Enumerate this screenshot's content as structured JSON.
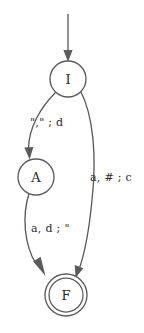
{
  "diagram": {
    "kind": "finite-state-automaton",
    "background_color": "#ffffff",
    "stroke_color": "#5b5b5b",
    "text_color": "#2b2b2b",
    "start_arrow": {
      "name": "start-arrow",
      "label": ""
    },
    "states": [
      {
        "id": "I",
        "label": "I",
        "type": "initial",
        "cx": 68,
        "cy": 79,
        "r": 18
      },
      {
        "id": "A",
        "label": "A",
        "type": "normal",
        "cx": 36,
        "cy": 177,
        "r": 18
      },
      {
        "id": "F",
        "label": "F",
        "type": "accepting",
        "cx": 66,
        "cy": 295,
        "r": 21,
        "r_inner": 17
      }
    ],
    "transitions": [
      {
        "id": "I-to-A",
        "from": "I",
        "to": "A",
        "label": "\",\" ; d",
        "label_x": 30,
        "label_y": 122
      },
      {
        "id": "I-to-F",
        "from": "I",
        "to": "F",
        "label": "a, # ; c",
        "label_x": 90,
        "label_y": 177
      },
      {
        "id": "A-to-F",
        "from": "A",
        "to": "F",
        "label": "a, d ; \"",
        "label_x": 31,
        "label_y": 228
      }
    ]
  }
}
